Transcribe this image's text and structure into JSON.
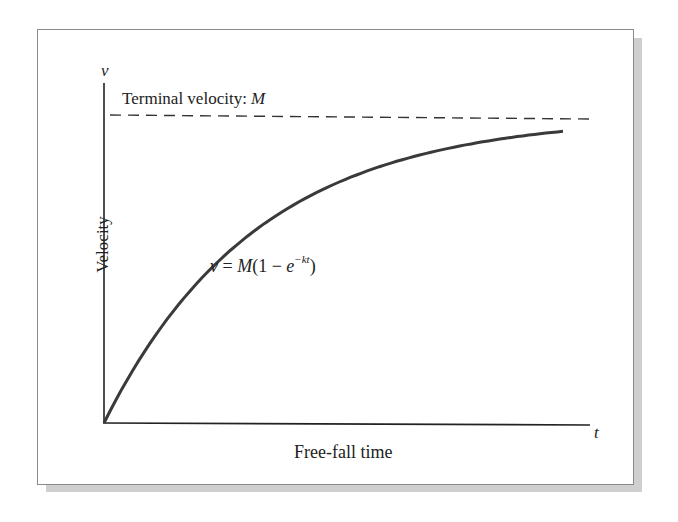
{
  "chart_data": {
    "type": "line",
    "title": "",
    "xlabel": "Free-fall time",
    "ylabel": "Velocity",
    "x_axis_symbol": "t",
    "y_axis_symbol": "v",
    "grid": false,
    "legend": null,
    "annotations": [
      {
        "text_prefix": "Terminal velocity: ",
        "text_var": "M",
        "type": "asymptote_label"
      },
      {
        "text": "v = M(1 − e^(−kt))",
        "type": "equation"
      }
    ],
    "asymptote": {
      "label": "Terminal velocity: M",
      "style": "dashed",
      "value": "M"
    },
    "series": [
      {
        "name": "v = M(1 - e^{-kt})",
        "function": "M*(1-exp(-k*t))",
        "params": {
          "M": 1.0,
          "k": 3.0
        },
        "x_range": [
          0,
          1
        ],
        "x": [
          0,
          0.1,
          0.2,
          0.3,
          0.4,
          0.5,
          0.6,
          0.7,
          0.8,
          0.9,
          1.0
        ],
        "values": [
          0,
          0.26,
          0.45,
          0.59,
          0.7,
          0.78,
          0.83,
          0.88,
          0.91,
          0.93,
          0.95
        ]
      }
    ],
    "xlim": [
      0,
      1.07
    ],
    "ylim": [
      0,
      1.1
    ]
  },
  "labels": {
    "y_symbol": "v",
    "x_symbol": "t",
    "terminal_prefix": "Terminal velocity: ",
    "terminal_var": "M",
    "ylabel": "Velocity",
    "xlabel": "Free-fall time",
    "eq_v": "v",
    "eq_eq": " = ",
    "eq_M": "M",
    "eq_open": "(1 − ",
    "eq_e": "e",
    "eq_exp": "−kt",
    "eq_close": ")"
  }
}
